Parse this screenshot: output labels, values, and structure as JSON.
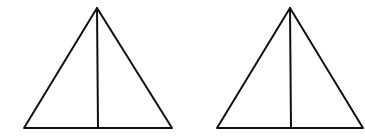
{
  "diagram": {
    "stroke_color": "#111111",
    "stroke_width": 2,
    "shapes": [
      {
        "name": "left-triangle",
        "apex": [
          97,
          8
        ],
        "base_left": [
          24,
          128
        ],
        "base_right": [
          172,
          128
        ],
        "median_bottom": [
          98,
          128
        ]
      },
      {
        "name": "right-triangle",
        "apex": [
          290,
          8
        ],
        "base_left": [
          217,
          128
        ],
        "base_right": [
          363,
          128
        ],
        "median_bottom": [
          291,
          128
        ]
      }
    ]
  }
}
